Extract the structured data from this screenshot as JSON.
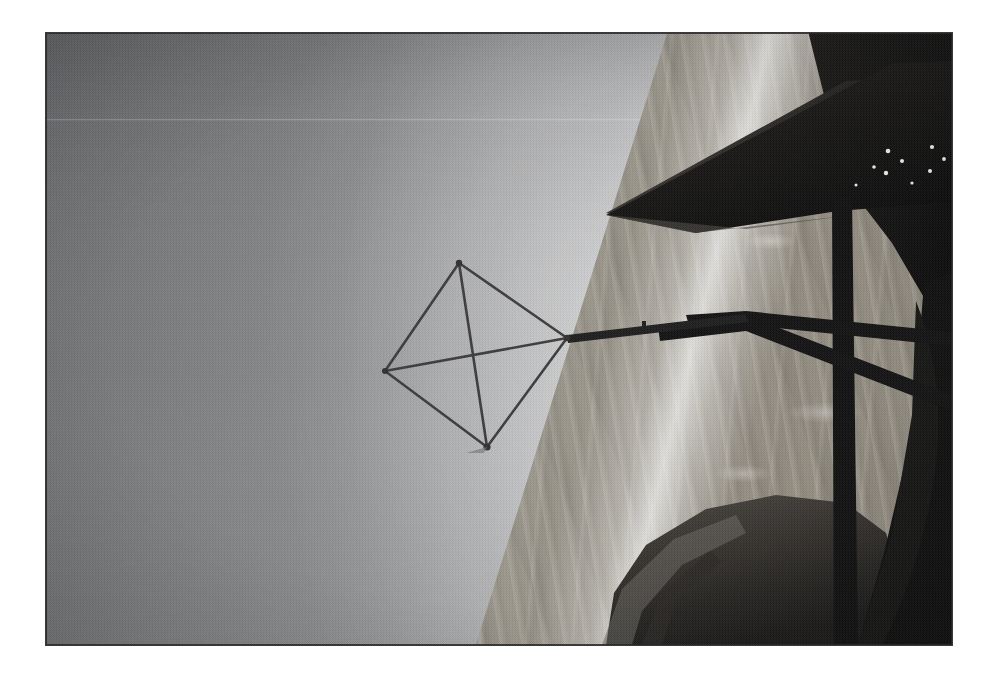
{
  "document": {
    "kind": "photograph",
    "title": "Aerial view from a microlight aircraft",
    "orientation": "rotated 90 degrees (landscape plate, portrait scene)",
    "medium": "black and white halftone print scan",
    "caption": ""
  },
  "plate": {
    "left": 46,
    "top": 33,
    "width": 906,
    "height": 612,
    "background_color": "#8d8d8d",
    "border_color": "#3a3a3a",
    "page_background": "#ffffff"
  },
  "scene": {
    "sky": {
      "label": "sky",
      "dark_tone": "#6f7073",
      "mid_tone": "#9b9c9e",
      "bright_tone": "#f7f7f6",
      "gradient_angle_deg": 105
    },
    "horizon": {
      "label": "horizon band",
      "description": "bright diagonal band separating sky from ground",
      "highlight_color": "#ffffff"
    },
    "ground": {
      "label": "terrain and fields seen from above",
      "light_tone": "#b6b1a8",
      "dark_tone": "#8e887c",
      "texture": "streaky ploughed fields"
    }
  },
  "aircraft": {
    "label": "microlight / hang glider",
    "color_dark": "#121212",
    "color_mid": "#2e2e2e",
    "parts": [
      {
        "name": "wing-leading-edge",
        "label": "wing leading edge"
      },
      {
        "name": "wing-panel",
        "label": "dark wing panel"
      },
      {
        "name": "mast",
        "label": "vertical mast / kingpost"
      },
      {
        "name": "cross-strut-upper",
        "label": "upper cross strut"
      },
      {
        "name": "cross-strut-lower",
        "label": "lower cross strut"
      },
      {
        "name": "fuselage-pod",
        "label": "fuselage pod / cockpit fairing"
      },
      {
        "name": "rivet-specks",
        "label": "bright rivet highlights"
      }
    ]
  },
  "kite_frame": {
    "label": "tetrahedral kite frame",
    "line_color": "#3c3c3c",
    "vertices": {
      "top": {
        "x": 413,
        "y": 230
      },
      "left": {
        "x": 339,
        "y": 338
      },
      "bottom": {
        "x": 441,
        "y": 414
      },
      "right": {
        "x": 521,
        "y": 305
      }
    },
    "edges": [
      "top-left",
      "top-right",
      "left-bottom",
      "bottom-right",
      "left-right",
      "top-bottom"
    ],
    "tether": {
      "label": "bridle / tether line",
      "bend_point": {
        "x": 699,
        "y": 285
      },
      "anchor": {
        "x": 800,
        "y": 262
      }
    }
  }
}
